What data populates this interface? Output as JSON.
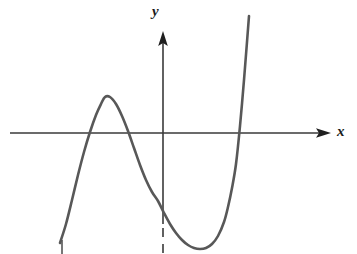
{
  "figure": {
    "background_color": "#ffffff",
    "width": 357,
    "height": 254
  },
  "axes": {
    "x_label": "x",
    "y_label": "y",
    "axis_color": "#3a3a3a",
    "origin": {
      "x": 163,
      "y": 133
    },
    "x_axis": {
      "start_x": 10,
      "end_x": 330,
      "y": 133,
      "arrow": "right"
    },
    "y_axis": {
      "x": 163,
      "top_y": 31,
      "bottom_y": 254,
      "arrow": "up",
      "dashed_below_y": 224
    },
    "ticks_visible": false,
    "tick_labels": []
  },
  "chart_data": {
    "type": "line",
    "title": "",
    "xlabel": "x",
    "ylabel": "y",
    "grid": false,
    "legend": null,
    "curve_color": "#585858",
    "curve_width": 2.6,
    "features": {
      "local_maximum": {
        "x": 105,
        "y": 97
      },
      "local_minimum": {
        "x": 203,
        "y": 249
      },
      "x_intercepts": [
        80,
        133,
        235
      ],
      "y_intercept": {
        "x": 163,
        "y": 195
      },
      "left_tail_end": {
        "x": 60,
        "y": 243
      },
      "right_tail_end": {
        "x": 249,
        "y": 16
      }
    },
    "path_points": [
      [
        60,
        243
      ],
      [
        66,
        224
      ],
      [
        72,
        200
      ],
      [
        78,
        175
      ],
      [
        84,
        152
      ],
      [
        90,
        132
      ],
      [
        96,
        115
      ],
      [
        101,
        104
      ],
      [
        105,
        97
      ],
      [
        110,
        97
      ],
      [
        116,
        104
      ],
      [
        122,
        116
      ],
      [
        128,
        131
      ],
      [
        134,
        148
      ],
      [
        140,
        165
      ],
      [
        146,
        180
      ],
      [
        152,
        192
      ],
      [
        158,
        201
      ],
      [
        164,
        213
      ],
      [
        170,
        224
      ],
      [
        176,
        233
      ],
      [
        182,
        240
      ],
      [
        188,
        245
      ],
      [
        194,
        248
      ],
      [
        200,
        249
      ],
      [
        206,
        248
      ],
      [
        212,
        244
      ],
      [
        218,
        236
      ],
      [
        224,
        222
      ],
      [
        228,
        207
      ],
      [
        232,
        188
      ],
      [
        236,
        164
      ],
      [
        240,
        126
      ],
      [
        244,
        80
      ],
      [
        247,
        42
      ],
      [
        249,
        16
      ]
    ],
    "bottom_tick": {
      "x": 62,
      "y_start": 240,
      "y_end": 254
    }
  }
}
